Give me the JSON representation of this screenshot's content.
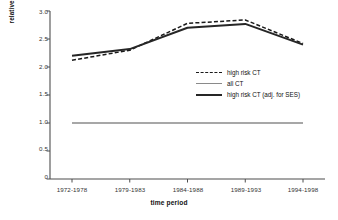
{
  "chart_data": {
    "type": "line",
    "title": "",
    "xlabel": "time period",
    "ylabel": "relative risk",
    "categories": [
      "1972-1978",
      "1979-1983",
      "1984-1988",
      "1989-1993",
      "1994-1998"
    ],
    "ylim": [
      0,
      3.0
    ],
    "yticks": [
      "0",
      "0.5",
      "1.0",
      "1.5",
      "2.0",
      "2.5",
      "3.0"
    ],
    "ytick_values": [
      0,
      0.5,
      1.0,
      1.5,
      2.0,
      2.5,
      3.0
    ],
    "grid": false,
    "legend_position": "center-right",
    "series": [
      {
        "name": "high risk CT",
        "style": "dashed",
        "color": "#1a1a1a",
        "values": [
          2.12,
          2.3,
          2.78,
          2.84,
          2.42
        ]
      },
      {
        "name": "all CT",
        "style": "solid-thin",
        "color": "#8a8a8a",
        "values": [
          1.0,
          1.0,
          1.0,
          1.0,
          1.0
        ]
      },
      {
        "name": "high risk CT (adj. for SES)",
        "style": "solid-thick",
        "color": "#262626",
        "values": [
          2.2,
          2.32,
          2.7,
          2.77,
          2.4
        ]
      }
    ]
  },
  "axis": {
    "y_title": "relative risk",
    "x_title": "time period"
  },
  "legend": {
    "items": [
      {
        "label": "high risk CT"
      },
      {
        "label": "all CT"
      },
      {
        "label": "high risk CT (adj. for SES)"
      }
    ]
  }
}
